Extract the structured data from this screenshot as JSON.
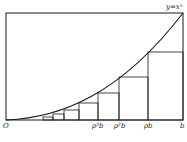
{
  "diagram": {
    "curve_label": "y=xⁿ",
    "origin_label": "O",
    "x_labels": [
      "ρ³b",
      "ρ²b",
      "ρb",
      "b"
    ],
    "frame": {
      "left": 6,
      "top": 13,
      "right": 183,
      "bottom": 120
    },
    "rectangles": [
      {
        "x0": 43,
        "x1": 53,
        "top": 117
      },
      {
        "x0": 53,
        "x1": 64,
        "top": 114
      },
      {
        "x0": 64,
        "x1": 79,
        "top": 110
      },
      {
        "x0": 79,
        "x1": 98,
        "top": 103
      },
      {
        "x0": 98,
        "x1": 119,
        "top": 93
      },
      {
        "x0": 119,
        "x1": 148,
        "top": 77
      },
      {
        "x0": 148,
        "x1": 183,
        "top": 52
      }
    ],
    "stroke_color": "#1a1a1a"
  }
}
